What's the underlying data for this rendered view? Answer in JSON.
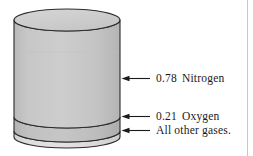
{
  "figure": {
    "cylinder": {
      "name": "air-column",
      "bands": [
        {
          "id": "nitrogen",
          "fraction": "0.78",
          "gas": "Nitrogen",
          "fill": "#c9c9c9",
          "top_face_fill": "#d2d2d2"
        },
        {
          "id": "oxygen",
          "fraction": "0.21",
          "gas": "Oxygen",
          "fill": "#bfbfbf"
        },
        {
          "id": "other-gases",
          "fraction": "",
          "gas": "All other gases.",
          "fill": "#dcdcdc"
        }
      ],
      "outline_color": "#2b2b2b"
    },
    "labels": {
      "nitrogen": {
        "value": "0.78",
        "text": "Nitrogen"
      },
      "oxygen": {
        "value": "0.21",
        "text": "Oxygen"
      },
      "other": {
        "value": "",
        "text": "All other gases."
      }
    },
    "arrows": {
      "count": 3,
      "direction": "left",
      "color": "#1a1a1a",
      "names": [
        "arrow-to-nitrogen",
        "arrow-to-oxygen",
        "arrow-to-other-gases"
      ]
    }
  }
}
